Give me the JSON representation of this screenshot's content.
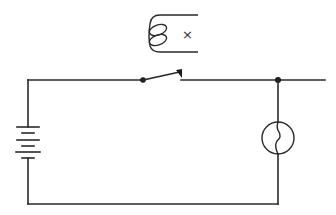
{
  "diagram": {
    "type": "electric circuit schematic",
    "components": [
      {
        "id": "battery",
        "label": "battery",
        "plates": 6
      },
      {
        "id": "switch",
        "label": "open switch"
      },
      {
        "id": "lamp",
        "label": "lamp"
      },
      {
        "id": "coil",
        "label": "coil / electromagnet",
        "marker": "×"
      },
      {
        "id": "junction",
        "label": "junction node"
      }
    ],
    "coil_marker": "×",
    "colors": {
      "line": "#2a2a2a",
      "background": "#ffffff"
    }
  }
}
